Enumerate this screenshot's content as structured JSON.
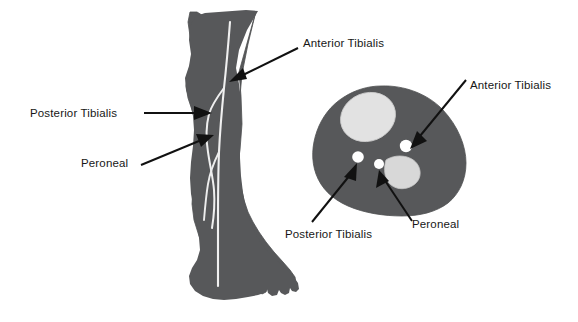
{
  "figure": {
    "background_color": "#ffffff",
    "width": 578,
    "height": 322
  },
  "palette": {
    "soft_tissue": "#57585a",
    "soft_tissue_edge": "#4b4c4e",
    "bone_light": "#e2e2e2",
    "bone_mid": "#d6d6d6",
    "vessel_line": "#f2f2f2",
    "artery_marker": "#ffffff",
    "leader_line": "#111111",
    "label_text": "#171717"
  },
  "views": {
    "lateral": {
      "name": "lateral-leg-view",
      "caption": ""
    },
    "cross_section": {
      "name": "leg-cross-section-view",
      "caption": ""
    }
  },
  "annotations": [
    {
      "id": "lateral-anterior-tibialis",
      "label": "Anterior Tibialis",
      "view": "lateral",
      "text_x": 303,
      "text_y": 47,
      "anchor": "start"
    },
    {
      "id": "lateral-posterior-tibialis",
      "label": "Posterior Tibialis",
      "view": "lateral",
      "text_x": 30,
      "text_y": 117,
      "anchor": "start"
    },
    {
      "id": "lateral-peroneal",
      "label": "Peroneal",
      "view": "lateral",
      "text_x": 81,
      "text_y": 167,
      "anchor": "start"
    },
    {
      "id": "cross-anterior-tibialis",
      "label": "Anterior Tibialis",
      "view": "cross_section",
      "text_x": 470,
      "text_y": 89,
      "anchor": "start"
    },
    {
      "id": "cross-posterior-tibialis",
      "label": "Posterior Tibialis",
      "view": "cross_section",
      "text_x": 285,
      "text_y": 238,
      "anchor": "start"
    },
    {
      "id": "cross-peroneal",
      "label": "Peroneal",
      "view": "cross_section",
      "text_x": 412,
      "text_y": 228,
      "anchor": "start"
    }
  ],
  "cross_section_structures": [
    {
      "id": "tibia",
      "kind": "bone",
      "label": ""
    },
    {
      "id": "fibula",
      "kind": "bone",
      "label": ""
    },
    {
      "id": "anterior-tibialis-artery",
      "kind": "artery",
      "label": ""
    },
    {
      "id": "posterior-tibialis-artery",
      "kind": "artery",
      "label": ""
    },
    {
      "id": "peroneal-artery",
      "kind": "artery",
      "label": ""
    }
  ]
}
